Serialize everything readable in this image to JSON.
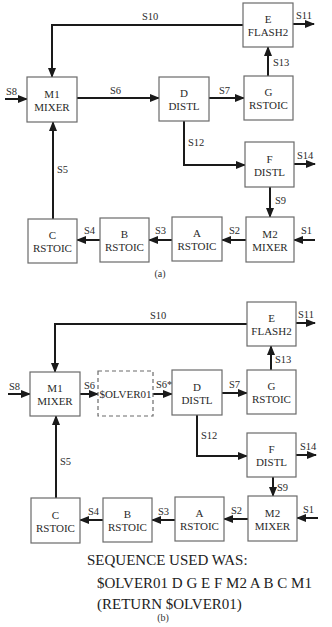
{
  "diagrams": [
    {
      "id": "a",
      "caption": "(a)",
      "caption_pos": [
        160,
        277
      ],
      "blocks": [
        {
          "id": "M1",
          "line1": "M1",
          "line2": "MIXER",
          "x": 27,
          "y": 77,
          "w": 50,
          "h": 45
        },
        {
          "id": "D",
          "line1": "D",
          "line2": "DISTL",
          "x": 159,
          "y": 77,
          "w": 50,
          "h": 44
        },
        {
          "id": "G",
          "line1": "G",
          "line2": "RSTOIC",
          "x": 244,
          "y": 76,
          "w": 49,
          "h": 44
        },
        {
          "id": "E",
          "line1": "E",
          "line2": "FLASH2",
          "x": 243,
          "y": 3,
          "w": 50,
          "h": 44
        },
        {
          "id": "F",
          "line1": "F",
          "line2": "DISTL",
          "x": 245,
          "y": 142,
          "w": 49,
          "h": 45
        },
        {
          "id": "M2",
          "line1": "M2",
          "line2": "MIXER",
          "x": 246,
          "y": 217,
          "w": 48,
          "h": 45
        },
        {
          "id": "A",
          "line1": "A",
          "line2": "RSTOIC",
          "x": 172,
          "y": 217,
          "w": 50,
          "h": 44
        },
        {
          "id": "B",
          "line1": "B",
          "line2": "RSTOIC",
          "x": 100,
          "y": 218,
          "w": 49,
          "h": 44
        },
        {
          "id": "C",
          "line1": "C",
          "line2": "RSTOIC",
          "x": 28,
          "y": 219,
          "w": 49,
          "h": 44
        }
      ],
      "streams": [
        {
          "name": "S8",
          "points": [
            [
              5,
              99
            ],
            [
              27,
              99
            ]
          ],
          "label_pos": [
            6,
            95
          ]
        },
        {
          "name": "S6",
          "points": [
            [
              77,
              98
            ],
            [
              159,
              98
            ]
          ],
          "label_pos": [
            110,
            94
          ]
        },
        {
          "name": "S7",
          "points": [
            [
              209,
              98
            ],
            [
              244,
              98
            ]
          ],
          "label_pos": [
            219,
            94
          ]
        },
        {
          "name": "S13",
          "points": [
            [
              268,
              76
            ],
            [
              268,
              47
            ]
          ],
          "label_pos": [
            273,
            66
          ]
        },
        {
          "name": "S11",
          "points": [
            [
              293,
              24
            ],
            [
              314,
              24
            ]
          ],
          "label_pos": [
            296,
            19
          ]
        },
        {
          "name": "S10",
          "points": [
            [
              243,
              25
            ],
            [
              52,
              25
            ],
            [
              52,
              77
            ]
          ],
          "label_pos": [
            142,
            20
          ]
        },
        {
          "name": "S12",
          "points": [
            [
              184,
              121
            ],
            [
              184,
              165
            ],
            [
              245,
              165
            ]
          ],
          "label_pos": [
            188,
            146
          ]
        },
        {
          "name": "S14",
          "points": [
            [
              294,
              164
            ],
            [
              315,
              164
            ]
          ],
          "label_pos": [
            297,
            159
          ]
        },
        {
          "name": "S9",
          "points": [
            [
              270,
              187
            ],
            [
              270,
              217
            ]
          ],
          "label_pos": [
            275,
            204
          ]
        },
        {
          "name": "S1",
          "points": [
            [
              315,
              240
            ],
            [
              294,
              240
            ]
          ],
          "label_pos": [
            301,
            234
          ]
        },
        {
          "name": "S2",
          "points": [
            [
              246,
              240
            ],
            [
              222,
              240
            ]
          ],
          "label_pos": [
            229,
            234
          ]
        },
        {
          "name": "S3",
          "points": [
            [
              172,
              240
            ],
            [
              149,
              240
            ]
          ],
          "label_pos": [
            155,
            234
          ]
        },
        {
          "name": "S4",
          "points": [
            [
              100,
              240
            ],
            [
              77,
              240
            ]
          ],
          "label_pos": [
            84,
            234
          ]
        },
        {
          "name": "S5",
          "points": [
            [
              53,
              219
            ],
            [
              53,
              122
            ]
          ],
          "label_pos": [
            57,
            173
          ]
        }
      ]
    },
    {
      "id": "b",
      "caption": "(b)",
      "caption_pos": [
        163,
        621
      ],
      "blocks": [
        {
          "id": "M1",
          "line1": "M1",
          "line2": "MIXER",
          "x": 30,
          "y": 372,
          "w": 50,
          "h": 44
        },
        {
          "id": "SOLVER",
          "line1": "$OLVER01",
          "line2": "",
          "x": 98,
          "y": 371,
          "w": 55,
          "h": 45,
          "dashed": true
        },
        {
          "id": "D",
          "line1": "D",
          "line2": "DISTL",
          "x": 172,
          "y": 370,
          "w": 50,
          "h": 45
        },
        {
          "id": "G",
          "line1": "G",
          "line2": "RSTOIC",
          "x": 247,
          "y": 370,
          "w": 49,
          "h": 44
        },
        {
          "id": "E",
          "line1": "E",
          "line2": "FLASH2",
          "x": 247,
          "y": 302,
          "w": 49,
          "h": 44
        },
        {
          "id": "F",
          "line1": "F",
          "line2": "DISTL",
          "x": 247,
          "y": 433,
          "w": 49,
          "h": 44
        },
        {
          "id": "M2",
          "line1": "M2",
          "line2": "MIXER",
          "x": 248,
          "y": 496,
          "w": 49,
          "h": 45
        },
        {
          "id": "A",
          "line1": "A",
          "line2": "RSTOIC",
          "x": 175,
          "y": 497,
          "w": 49,
          "h": 44
        },
        {
          "id": "B",
          "line1": "B",
          "line2": "RSTOIC",
          "x": 103,
          "y": 498,
          "w": 49,
          "h": 44
        },
        {
          "id": "C",
          "line1": "C",
          "line2": "RSTOIC",
          "x": 31,
          "y": 498,
          "w": 49,
          "h": 45
        }
      ],
      "streams": [
        {
          "name": "S8",
          "points": [
            [
              8,
              394
            ],
            [
              30,
              394
            ]
          ],
          "label_pos": [
            9,
            390
          ]
        },
        {
          "name": "S6",
          "points": [
            [
              80,
              394
            ],
            [
              98,
              394
            ]
          ],
          "label_pos": [
            84,
            389
          ]
        },
        {
          "name": "S6*",
          "points": [
            [
              153,
              394
            ],
            [
              172,
              394
            ]
          ],
          "label_pos": [
            156,
            388
          ]
        },
        {
          "name": "S7",
          "points": [
            [
              222,
              393
            ],
            [
              247,
              393
            ]
          ],
          "label_pos": [
            229,
            388
          ]
        },
        {
          "name": "S13",
          "points": [
            [
              271,
              370
            ],
            [
              271,
              346
            ]
          ],
          "label_pos": [
            275,
            363
          ]
        },
        {
          "name": "S11",
          "points": [
            [
              296,
              323
            ],
            [
              315,
              323
            ]
          ],
          "label_pos": [
            298,
            318
          ]
        },
        {
          "name": "S10",
          "points": [
            [
              247,
              324
            ],
            [
              55,
              324
            ],
            [
              55,
              372
            ]
          ],
          "label_pos": [
            150,
            319
          ]
        },
        {
          "name": "S12",
          "points": [
            [
              197,
              415
            ],
            [
              197,
              456
            ],
            [
              247,
              456
            ]
          ],
          "label_pos": [
            201,
            439
          ]
        },
        {
          "name": "S14",
          "points": [
            [
              296,
              455
            ],
            [
              316,
              455
            ]
          ],
          "label_pos": [
            300,
            450
          ]
        },
        {
          "name": "S9",
          "points": [
            [
              273,
              477
            ],
            [
              273,
              496
            ]
          ],
          "label_pos": [
            277,
            491
          ]
        },
        {
          "name": "S1",
          "points": [
            [
              318,
              518
            ],
            [
              297,
              518
            ]
          ],
          "label_pos": [
            303,
            513
          ]
        },
        {
          "name": "S2",
          "points": [
            [
              248,
              519
            ],
            [
              224,
              519
            ]
          ],
          "label_pos": [
            231,
            514
          ]
        },
        {
          "name": "S3",
          "points": [
            [
              175,
              520
            ],
            [
              152,
              520
            ]
          ],
          "label_pos": [
            158,
            515
          ]
        },
        {
          "name": "S4",
          "points": [
            [
              103,
              520
            ],
            [
              80,
              520
            ]
          ],
          "label_pos": [
            88,
            515
          ]
        },
        {
          "name": "S5",
          "points": [
            [
              56,
              498
            ],
            [
              56,
              416
            ]
          ],
          "label_pos": [
            60,
            465
          ]
        }
      ]
    }
  ],
  "sequence": {
    "heading": "SEQUENCE USED WAS:",
    "order": "$OLVER01 D G E F M2 A B C M1",
    "return_note": "(RETURN $OLVER01)"
  }
}
